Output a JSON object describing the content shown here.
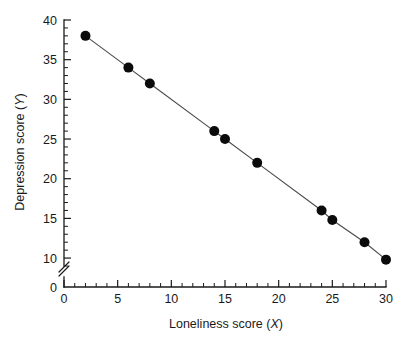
{
  "chart_data": {
    "type": "scatter",
    "title": "",
    "subtitle": "",
    "xlabel": "Loneliness score (X)",
    "xlabel_text": "Loneliness score (",
    "xlabel_var": "X",
    "xlabel_close": ")",
    "ylabel": "Depression score (Y)",
    "ylabel_text": "Depression score (",
    "ylabel_var": "Y",
    "ylabel_close": ")",
    "x": [
      2,
      6,
      8,
      14,
      15,
      18,
      24,
      25,
      28,
      30
    ],
    "values": [
      38,
      34,
      32,
      26,
      25,
      22,
      16,
      14.8,
      12,
      9.8
    ],
    "points": [
      {
        "x": 2,
        "y": 38
      },
      {
        "x": 6,
        "y": 34
      },
      {
        "x": 8,
        "y": 32
      },
      {
        "x": 14,
        "y": 26
      },
      {
        "x": 15,
        "y": 25
      },
      {
        "x": 18,
        "y": 22
      },
      {
        "x": 24,
        "y": 16
      },
      {
        "x": 25,
        "y": 14.8
      },
      {
        "x": 28,
        "y": 12
      },
      {
        "x": 30,
        "y": 9.8
      }
    ],
    "connected": true,
    "xlim": [
      0,
      30
    ],
    "ylim": [
      0,
      40
    ],
    "y_plot_min": 9,
    "y_axis_break": true,
    "y_axis_break_between": [
      0,
      9
    ],
    "xticks": [
      0,
      5,
      10,
      15,
      20,
      25,
      30
    ],
    "xtick_labels": [
      "0",
      "5",
      "10",
      "15",
      "20",
      "25",
      "30"
    ],
    "x_minor_step": 1,
    "yticks": [
      0,
      10,
      15,
      20,
      25,
      30,
      35,
      40
    ],
    "ytick_labels": [
      "0",
      "10",
      "15",
      "20",
      "25",
      "30",
      "35",
      "40"
    ],
    "y_minor_step": 1,
    "grid": false,
    "legend": null,
    "legend_position": "none",
    "marker": "filled-circle",
    "marker_size": 5,
    "colors": {
      "marker": "#0b0b0b",
      "line": "#4d4d4d",
      "axis": "#1a1a1a",
      "background": "#ffffff",
      "text": "#1a1a1a"
    }
  }
}
